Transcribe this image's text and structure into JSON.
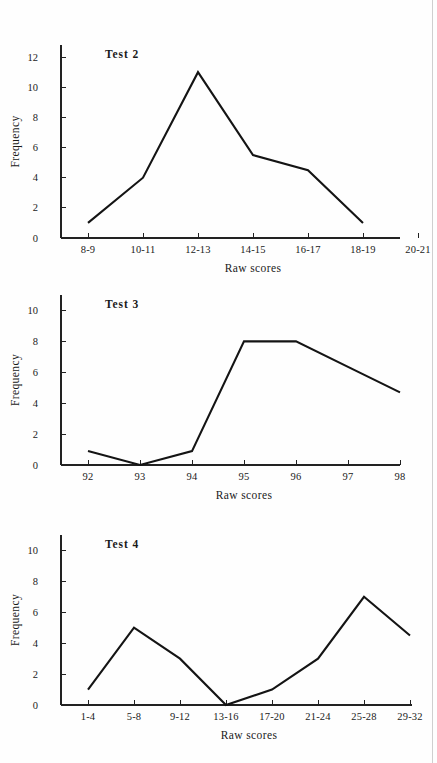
{
  "page": {
    "background_color": "#fefefe",
    "ink_color": "#141414",
    "edge_line_color": "#cfcfcf"
  },
  "charts": [
    {
      "id": "test-2",
      "title": "Test 2",
      "xlabel": "Raw scores",
      "ylabel": "Frequency",
      "categories": [
        "8-9",
        "10-11",
        "12-13",
        "14-15",
        "16-17",
        "18-19",
        "20-21"
      ],
      "values": [
        1,
        4,
        11,
        5.5,
        4.5,
        1,
        null
      ],
      "yticks": [
        0,
        2,
        4,
        6,
        8,
        10,
        12
      ],
      "ylim": [
        0,
        12.8
      ],
      "grid": false,
      "legend": "none"
    },
    {
      "id": "test-3",
      "title": "Test 3",
      "xlabel": "Raw scores",
      "ylabel": "Frequency",
      "categories": [
        "92",
        "93",
        "94",
        "95",
        "96",
        "97",
        "98"
      ],
      "values": [
        0.9,
        0,
        0.9,
        8,
        8,
        6.35,
        4.7
      ],
      "yticks": [
        0,
        2,
        4,
        6,
        8,
        10
      ],
      "ylim": [
        0,
        11.0
      ],
      "grid": false,
      "legend": "none"
    },
    {
      "id": "test-4",
      "title": "Test 4",
      "xlabel": "Raw scores",
      "ylabel": "Frequency",
      "categories": [
        "1-4",
        "5-8",
        "9-12",
        "13-16",
        "17-20",
        "21-24",
        "25-28",
        "29-32"
      ],
      "values": [
        1,
        5,
        3,
        0,
        1,
        3,
        7,
        4.5
      ],
      "yticks": [
        0,
        2,
        4,
        6,
        8,
        10
      ],
      "ylim": [
        0,
        11.0
      ],
      "grid": false,
      "legend": "none"
    }
  ],
  "chart_data": [
    {
      "type": "line",
      "title": "Test 2",
      "xlabel": "Raw scores",
      "ylabel": "Frequency",
      "categories": [
        "8-9",
        "10-11",
        "12-13",
        "14-15",
        "16-17",
        "18-19",
        "20-21"
      ],
      "values": [
        1,
        4,
        11,
        5.5,
        4.5,
        1,
        null
      ],
      "yticks": [
        0,
        2,
        4,
        6,
        8,
        10,
        12
      ],
      "ylim": [
        0,
        12.8
      ],
      "grid": false,
      "legend": "none",
      "notes": "Frequency polygon; no data plotted at category 20-21"
    },
    {
      "type": "line",
      "title": "Test 3",
      "xlabel": "Raw scores",
      "ylabel": "Frequency",
      "categories": [
        "92",
        "93",
        "94",
        "95",
        "96",
        "97",
        "98"
      ],
      "values": [
        0.9,
        0,
        0.9,
        8,
        8,
        6.35,
        4.7
      ],
      "yticks": [
        0,
        2,
        4,
        6,
        8,
        10
      ],
      "ylim": [
        0,
        11.0
      ],
      "grid": false,
      "legend": "none",
      "notes": "Frequency polygon; straight segment from 96 to 98 passes through 97"
    },
    {
      "type": "line",
      "title": "Test 4",
      "xlabel": "Raw scores",
      "ylabel": "Frequency",
      "categories": [
        "1-4",
        "5-8",
        "9-12",
        "13-16",
        "17-20",
        "21-24",
        "25-28",
        "29-32"
      ],
      "values": [
        1,
        5,
        3,
        0,
        1,
        3,
        7,
        4.5
      ],
      "yticks": [
        0,
        2,
        4,
        6,
        8,
        10
      ],
      "ylim": [
        0,
        11.0
      ],
      "grid": false,
      "legend": "none",
      "notes": "Frequency polygon"
    }
  ]
}
